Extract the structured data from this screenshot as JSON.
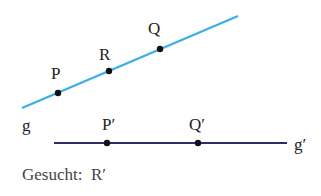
{
  "diagram": {
    "line_g": {
      "label": "g",
      "color": "#3aaee6",
      "x1": 22,
      "y1": 108,
      "x2": 238,
      "y2": 16,
      "label_x": 22,
      "label_y": 131
    },
    "line_g_prime": {
      "label": "g′",
      "color": "#2b2d6e",
      "x1": 54,
      "y1": 143,
      "x2": 287,
      "y2": 143,
      "label_x": 294,
      "label_y": 150
    },
    "points": [
      {
        "name": "P",
        "x": 58,
        "y": 93,
        "label_x": 51,
        "label_y": 79
      },
      {
        "name": "R",
        "x": 109,
        "y": 71,
        "label_x": 99,
        "label_y": 60
      },
      {
        "name": "Q",
        "x": 160,
        "y": 49,
        "label_x": 148,
        "label_y": 34
      },
      {
        "name": "P′",
        "x": 107,
        "y": 143,
        "label_x": 102,
        "label_y": 130
      },
      {
        "name": "Q′",
        "x": 198,
        "y": 143,
        "label_x": 189,
        "label_y": 130
      }
    ],
    "point_color": "#111111"
  },
  "caption": "Gesucht:  R′"
}
